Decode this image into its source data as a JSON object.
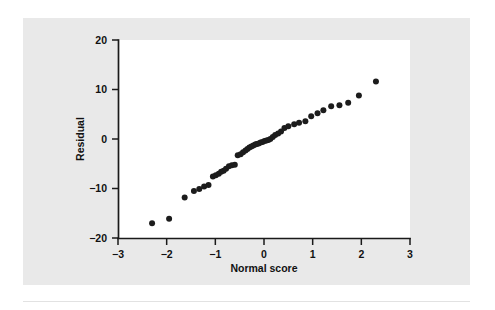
{
  "figure": {
    "panel_color": "#e9e9e9",
    "plot_bg_color": "#ffffff",
    "marker_color": "#1c1c1c",
    "axis_color": "#1a1a1a"
  },
  "chart_data": {
    "type": "scatter",
    "title": "",
    "xlabel": "Normal score",
    "ylabel": "Residual",
    "xlim": [
      -3,
      3
    ],
    "ylim": [
      -20,
      20
    ],
    "xticks": [
      -3,
      -2,
      -1,
      0,
      1,
      2,
      3
    ],
    "xticklabels": [
      "−3",
      "−2",
      "−1",
      "0",
      "1",
      "2",
      "3"
    ],
    "yticks": [
      -20,
      -10,
      0,
      10,
      20
    ],
    "yticklabels": [
      "−20",
      "−10",
      "0",
      "10",
      "20"
    ],
    "grid": false,
    "legend": null,
    "marker": "filled-circle",
    "marker_size": 3.0,
    "points": [
      {
        "x": -2.3,
        "y": -17.0
      },
      {
        "x": -1.95,
        "y": -16.1
      },
      {
        "x": -1.63,
        "y": -11.8
      },
      {
        "x": -1.44,
        "y": -10.5
      },
      {
        "x": -1.33,
        "y": -10.1
      },
      {
        "x": -1.23,
        "y": -9.6
      },
      {
        "x": -1.14,
        "y": -9.3
      },
      {
        "x": -1.05,
        "y": -7.6
      },
      {
        "x": -0.99,
        "y": -7.3
      },
      {
        "x": -0.93,
        "y": -7.0
      },
      {
        "x": -0.88,
        "y": -6.6
      },
      {
        "x": -0.83,
        "y": -6.4
      },
      {
        "x": -0.78,
        "y": -6.0
      },
      {
        "x": -0.72,
        "y": -5.5
      },
      {
        "x": -0.66,
        "y": -5.3
      },
      {
        "x": -0.6,
        "y": -5.2
      },
      {
        "x": -0.54,
        "y": -3.3
      },
      {
        "x": -0.48,
        "y": -3.1
      },
      {
        "x": -0.43,
        "y": -2.7
      },
      {
        "x": -0.38,
        "y": -2.3
      },
      {
        "x": -0.34,
        "y": -2.0
      },
      {
        "x": -0.3,
        "y": -1.7
      },
      {
        "x": -0.26,
        "y": -1.5
      },
      {
        "x": -0.22,
        "y": -1.3
      },
      {
        "x": -0.18,
        "y": -1.1
      },
      {
        "x": -0.15,
        "y": -1.0
      },
      {
        "x": -0.11,
        "y": -0.9
      },
      {
        "x": -0.07,
        "y": -0.7
      },
      {
        "x": -0.03,
        "y": -0.6
      },
      {
        "x": 0.01,
        "y": -0.4
      },
      {
        "x": 0.05,
        "y": -0.3
      },
      {
        "x": 0.09,
        "y": -0.2
      },
      {
        "x": 0.13,
        "y": 0.0
      },
      {
        "x": 0.18,
        "y": 0.4
      },
      {
        "x": 0.23,
        "y": 0.8
      },
      {
        "x": 0.29,
        "y": 1.1
      },
      {
        "x": 0.35,
        "y": 1.5
      },
      {
        "x": 0.42,
        "y": 2.2
      },
      {
        "x": 0.5,
        "y": 2.6
      },
      {
        "x": 0.62,
        "y": 3.0
      },
      {
        "x": 0.72,
        "y": 3.3
      },
      {
        "x": 0.85,
        "y": 3.6
      },
      {
        "x": 0.97,
        "y": 4.6
      },
      {
        "x": 1.1,
        "y": 5.2
      },
      {
        "x": 1.22,
        "y": 5.8
      },
      {
        "x": 1.38,
        "y": 6.6
      },
      {
        "x": 1.55,
        "y": 6.8
      },
      {
        "x": 1.73,
        "y": 7.3
      },
      {
        "x": 1.95,
        "y": 8.8
      },
      {
        "x": 2.3,
        "y": 11.6
      }
    ]
  }
}
